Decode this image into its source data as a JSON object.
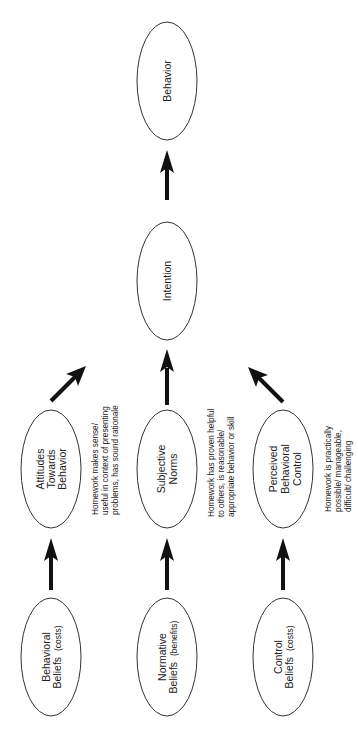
{
  "diagram": {
    "type": "theory-of-planned-behavior-flow",
    "orientation": "rotated-90-ccw",
    "nodes": {
      "behavior": {
        "label": "Behavior"
      },
      "intention": {
        "label": "Intention"
      },
      "attitudes": {
        "lines": [
          "Attitudes",
          "Towards",
          "Behavior"
        ]
      },
      "subjective_norms": {
        "lines": [
          "Subjective",
          "Norms"
        ]
      },
      "pbc": {
        "lines": [
          "Perceived",
          "Behavioral",
          "Control"
        ]
      },
      "behavioral_beliefs": {
        "line1": "Behavioral",
        "line2": "Beliefs",
        "qualifier": "(costs)"
      },
      "normative_beliefs": {
        "line1": "Normative",
        "line2": "Beliefs",
        "qualifier": "(benefits)"
      },
      "control_beliefs": {
        "line1": "Control",
        "line2": "Beliefs",
        "qualifier": "(costs)"
      }
    },
    "notes": {
      "attitudes": [
        "Homework makes sense/",
        "useful in context of presenting",
        "problems, has sound rationale"
      ],
      "subjective_norms": [
        "Homework has proven helpful",
        "to others, is reasonable/",
        "appropriate behavior or skill"
      ],
      "pbc": [
        "Homework is practically",
        "possible/  manageable,",
        "difficult/ challenging"
      ]
    },
    "edges": [
      {
        "from": "behavioral_beliefs",
        "to": "attitudes"
      },
      {
        "from": "normative_beliefs",
        "to": "subjective_norms"
      },
      {
        "from": "control_beliefs",
        "to": "pbc"
      },
      {
        "from": "attitudes",
        "to": "intention"
      },
      {
        "from": "subjective_norms",
        "to": "intention"
      },
      {
        "from": "pbc",
        "to": "intention"
      },
      {
        "from": "intention",
        "to": "behavior"
      }
    ]
  }
}
